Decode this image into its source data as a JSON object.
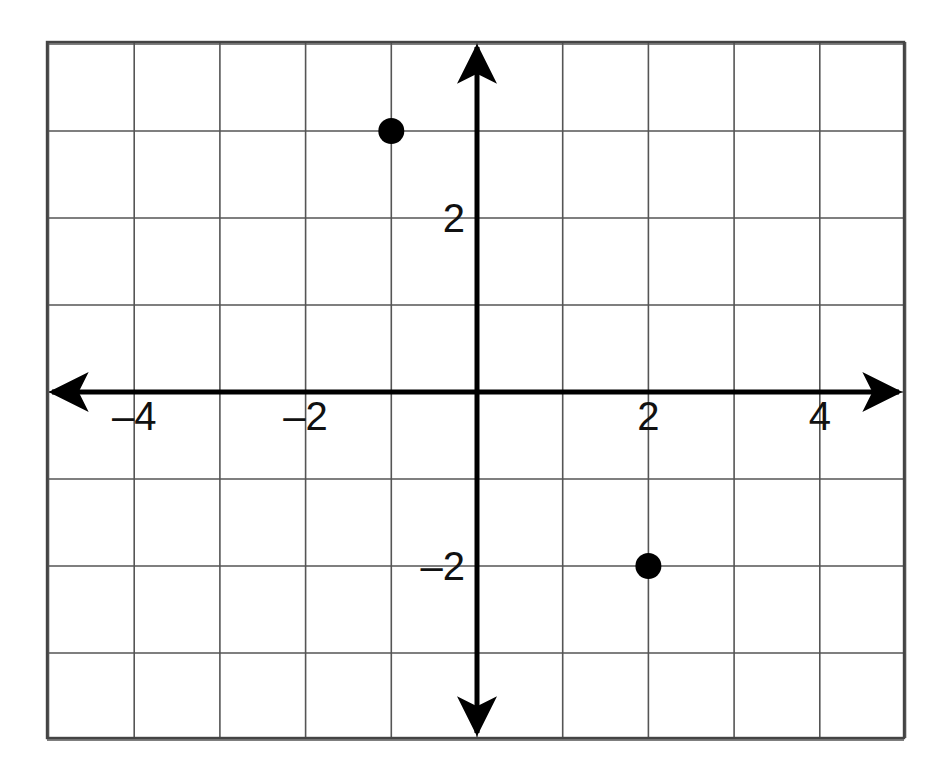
{
  "chart_data": {
    "type": "scatter",
    "title": "",
    "xlabel": "",
    "ylabel": "",
    "xlim": [
      -5,
      5
    ],
    "ylim": [
      -4,
      4
    ],
    "grid": true,
    "grid_step": 1,
    "legend": "none",
    "axes": {
      "x_axis_label": "x-axis",
      "y_axis_label": "y-axis",
      "arrowheads": "both-ends-both-axes",
      "origin_label": ""
    },
    "x_tick_labels": [
      {
        "value": -4,
        "text": "–4"
      },
      {
        "value": -2,
        "text": "–2"
      },
      {
        "value": 2,
        "text": "2"
      },
      {
        "value": 4,
        "text": "4"
      }
    ],
    "y_tick_labels": [
      {
        "value": 2,
        "text": "2"
      },
      {
        "value": -2,
        "text": "–2"
      }
    ],
    "points": [
      {
        "label": "point-1",
        "x": -1,
        "y": 3
      },
      {
        "label": "point-2",
        "x": 2,
        "y": -2
      }
    ],
    "series": [
      {
        "name": "plotted points",
        "x": [
          -1,
          2
        ],
        "y": [
          3,
          -2
        ],
        "marker": "filled-circle",
        "marker_color": "#000000",
        "marker_radius_px": 13
      }
    ]
  },
  "style": {
    "background": "#ffffff",
    "grid_color": "#555555",
    "border_color": "#444444",
    "axis_color": "#000000",
    "point_color": "#000000",
    "label_color": "#111111"
  },
  "geometry": {
    "grid_left_px": 47,
    "grid_top_px": 42,
    "grid_right_px": 904,
    "grid_bottom_px": 738,
    "origin_x_px": 477,
    "origin_y_px": 392,
    "unit_x_px": 85.7,
    "unit_y_px": 87.0
  }
}
